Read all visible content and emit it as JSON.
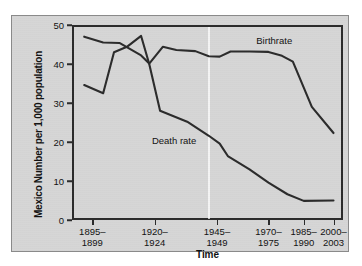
{
  "figure": {
    "background_color": "#d6d6d6",
    "ink_color": "#2b2b2b"
  },
  "chart_data": {
    "type": "line",
    "title": "",
    "xlabel": "Time",
    "ylabel": "Mexico Number per 1,000 population",
    "ylabel_lines": [
      "Mexico",
      "Number per 1,000 population"
    ],
    "ylim": [
      0,
      50
    ],
    "yticks": [
      0,
      10,
      20,
      30,
      40,
      50
    ],
    "ytick_labels": [
      "0",
      "10",
      "20",
      "30",
      "40",
      "50"
    ],
    "grid": false,
    "legend_position": "inline-annotations",
    "categories": [
      "1895–1899",
      "1920–1924",
      "1945–1949",
      "1970–1975",
      "1985–1990",
      "2000–2003"
    ],
    "xtick_labels": [
      [
        "1895–",
        "1899"
      ],
      [
        "1920–",
        "1924"
      ],
      [
        "1945–",
        "1949"
      ],
      [
        "1970–",
        "1975"
      ],
      [
        "1985–",
        "1990"
      ],
      [
        "2000–",
        "2003"
      ]
    ],
    "xtick_positions": [
      0.075,
      0.305,
      0.535,
      0.725,
      0.855,
      0.965
    ],
    "series": [
      {
        "name": "Birthrate",
        "label_text": "Birthrate",
        "label_x": 0.68,
        "label_y": 45.8,
        "points": [
          {
            "x": 0.045,
            "y": 47.0
          },
          {
            "x": 0.115,
            "y": 45.5
          },
          {
            "x": 0.175,
            "y": 45.4
          },
          {
            "x": 0.255,
            "y": 42.2
          },
          {
            "x": 0.285,
            "y": 40.1
          },
          {
            "x": 0.335,
            "y": 44.4
          },
          {
            "x": 0.385,
            "y": 43.6
          },
          {
            "x": 0.455,
            "y": 43.3
          },
          {
            "x": 0.505,
            "y": 42.0
          },
          {
            "x": 0.545,
            "y": 41.9
          },
          {
            "x": 0.585,
            "y": 43.2
          },
          {
            "x": 0.655,
            "y": 43.2
          },
          {
            "x": 0.725,
            "y": 43.1
          },
          {
            "x": 0.775,
            "y": 42.1
          },
          {
            "x": 0.815,
            "y": 40.6
          },
          {
            "x": 0.885,
            "y": 29.0
          },
          {
            "x": 0.965,
            "y": 22.3
          }
        ]
      },
      {
        "name": "Death rate",
        "label_text": "Death rate",
        "label_x": 0.295,
        "label_y": 20.2,
        "points": [
          {
            "x": 0.045,
            "y": 34.6
          },
          {
            "x": 0.115,
            "y": 32.5
          },
          {
            "x": 0.155,
            "y": 43.0
          },
          {
            "x": 0.205,
            "y": 44.5
          },
          {
            "x": 0.255,
            "y": 47.2
          },
          {
            "x": 0.285,
            "y": 40.0
          },
          {
            "x": 0.325,
            "y": 28.0
          },
          {
            "x": 0.425,
            "y": 25.2
          },
          {
            "x": 0.505,
            "y": 21.6
          },
          {
            "x": 0.545,
            "y": 19.6
          },
          {
            "x": 0.575,
            "y": 16.4
          },
          {
            "x": 0.655,
            "y": 13.0
          },
          {
            "x": 0.725,
            "y": 9.6
          },
          {
            "x": 0.795,
            "y": 6.6
          },
          {
            "x": 0.855,
            "y": 4.9
          },
          {
            "x": 0.965,
            "y": 5.0
          }
        ]
      }
    ]
  }
}
